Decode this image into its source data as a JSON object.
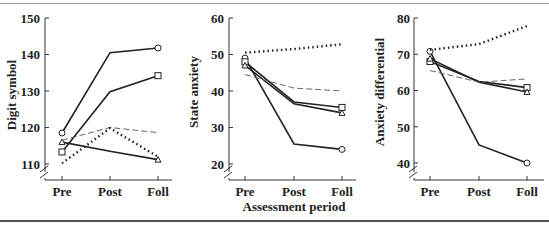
{
  "chart_data": [
    {
      "type": "line",
      "ylabel": "Digit symbol",
      "xlabel": "",
      "categories": [
        "Pre",
        "Post",
        "Foll"
      ],
      "yticks": [
        110,
        120,
        130,
        140,
        150
      ],
      "ylim": [
        110,
        150
      ],
      "axis_break": true,
      "series": [
        {
          "name": "solid-circle",
          "style": "solid",
          "marker": "circle",
          "values": [
            118.5,
            140.5,
            141.8
          ]
        },
        {
          "name": "solid-square",
          "style": "solid",
          "marker": "square",
          "values": [
            113.3,
            129.8,
            134.2
          ]
        },
        {
          "name": "solid-triangle",
          "style": "solid",
          "marker": "triangle",
          "values": [
            116,
            113.5,
            111.2
          ]
        },
        {
          "name": "dashed",
          "style": "dashed",
          "marker": "none",
          "values": [
            116.5,
            120,
            118.6
          ]
        },
        {
          "name": "dotted",
          "style": "dotted",
          "marker": "none",
          "values": [
            110.2,
            119.8,
            112
          ]
        }
      ]
    },
    {
      "type": "line",
      "ylabel": "State anxiety",
      "xlabel": "Assessment period",
      "categories": [
        "Pre",
        "Post",
        "Foll"
      ],
      "yticks": [
        20,
        30,
        40,
        50,
        60
      ],
      "ylim": [
        20,
        60
      ],
      "axis_break": true,
      "series": [
        {
          "name": "solid-circle",
          "style": "solid",
          "marker": "circle",
          "values": [
            49,
            25.5,
            24
          ]
        },
        {
          "name": "solid-square",
          "style": "solid",
          "marker": "square",
          "values": [
            48,
            37,
            35.5
          ]
        },
        {
          "name": "solid-triangle",
          "style": "solid",
          "marker": "triangle",
          "values": [
            47,
            36.5,
            34
          ]
        },
        {
          "name": "dashed",
          "style": "dashed",
          "marker": "none",
          "values": [
            44.5,
            40.8,
            40
          ]
        },
        {
          "name": "dotted",
          "style": "dotted",
          "marker": "none",
          "values": [
            50.5,
            51.5,
            52.8
          ]
        }
      ]
    },
    {
      "type": "line",
      "ylabel": "Anxiety differential",
      "xlabel": "",
      "categories": [
        "Pre",
        "Post",
        "Foll"
      ],
      "yticks": [
        40,
        50,
        60,
        70,
        80
      ],
      "ylim": [
        40,
        80
      ],
      "axis_break": true,
      "series": [
        {
          "name": "solid-circle",
          "style": "solid",
          "marker": "circle",
          "values": [
            70.8,
            45,
            40
          ]
        },
        {
          "name": "solid-square",
          "style": "solid",
          "marker": "square",
          "values": [
            68,
            62.5,
            60.8
          ]
        },
        {
          "name": "solid-triangle",
          "style": "solid",
          "marker": "triangle",
          "values": [
            68.8,
            62.3,
            59.6
          ]
        },
        {
          "name": "dashed",
          "style": "dashed",
          "marker": "none",
          "values": [
            65.5,
            62.3,
            63.2
          ]
        },
        {
          "name": "dotted",
          "style": "dotted",
          "marker": "none",
          "values": [
            71.2,
            72.8,
            77.8
          ]
        }
      ]
    }
  ],
  "panels": [
    {
      "ylabel": "Digit symbol",
      "ticks": [
        "150",
        "140",
        "130",
        "120",
        "110"
      ],
      "x": [
        "Pre",
        "Post",
        "Foll"
      ]
    },
    {
      "ylabel": "State anxiety",
      "ticks": [
        "60",
        "50",
        "40",
        "30",
        "20"
      ],
      "x": [
        "Pre",
        "Post",
        "Foll"
      ]
    },
    {
      "ylabel": "Anxiety differential",
      "ticks": [
        "80",
        "70",
        "60",
        "50",
        "40"
      ],
      "x": [
        "Pre",
        "Post",
        "Foll"
      ]
    }
  ],
  "xlabel": "Assessment period"
}
